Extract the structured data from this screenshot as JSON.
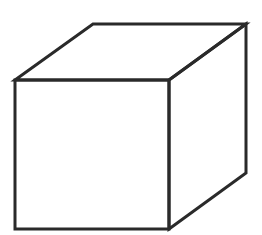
{
  "figure": {
    "style": "line drawing",
    "background": "#ffffff",
    "stroke_color": "#2a2a2a",
    "stroke_width": 3,
    "vertices": {
      "front_top_left": [
        15,
        80
      ],
      "front_top_right": [
        169,
        80
      ],
      "front_bottom_right": [
        169,
        229
      ],
      "front_bottom_left": [
        15,
        229
      ],
      "back_top_left": [
        93,
        24
      ],
      "back_top_right": [
        246,
        24
      ],
      "back_bottom_right": [
        246,
        173
      ]
    }
  }
}
